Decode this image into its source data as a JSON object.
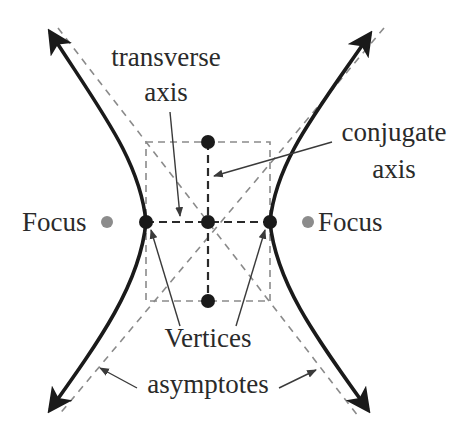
{
  "diagram": {
    "type": "hyperbola",
    "labels": {
      "transverse_line1": "transverse",
      "transverse_line2": "axis",
      "conjugate_line1": "conjugate",
      "conjugate_line2": "axis",
      "focus_left": "Focus",
      "focus_right": "Focus",
      "vertices": "Vertices",
      "asymptotes": "asymptotes"
    },
    "points": {
      "center": [
        208,
        222
      ],
      "vertex_left": [
        146,
        222
      ],
      "vertex_right": [
        270,
        222
      ],
      "covertex_top": [
        208,
        142
      ],
      "covertex_bottom": [
        208,
        301
      ],
      "focus_left": [
        102,
        222
      ],
      "focus_right": [
        308,
        222
      ]
    },
    "colors": {
      "curve": "#1a1a1a",
      "dashed_guides": "#8a8a8a",
      "axes_dashed": "#2a2a2a",
      "focus_dot": "#8c8c8c",
      "vertex_dot": "#1a1a1a",
      "pointer": "#3a3a3a"
    }
  }
}
